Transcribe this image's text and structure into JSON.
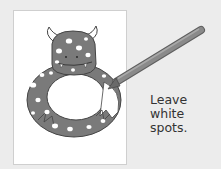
{
  "caption": {
    "lines": [
      "Leave",
      "white",
      "spots."
    ]
  },
  "illustration": {
    "subject": "spotted monster coloring page",
    "tool": "gray crayon",
    "colors": {
      "background": "#ececec",
      "paper": "#ffffff",
      "monster_fill": "#7a7a7a",
      "spots": "#ffffff",
      "outline": "#444444",
      "crayon": "#8a8a8a"
    }
  }
}
